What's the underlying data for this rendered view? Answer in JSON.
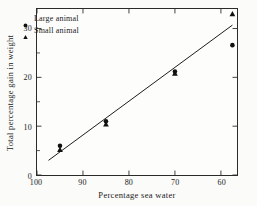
{
  "chart_data": {
    "type": "scatter",
    "title": "",
    "xlabel": "Percentage sea water",
    "ylabel": "Total percentage gain in weight",
    "xlim": [
      100,
      56.5
    ],
    "ylim": [
      0,
      34
    ],
    "x_axis_reversed": true,
    "grid": false,
    "xticks": [
      100,
      90,
      80,
      70,
      60
    ],
    "xtick_labels": [
      "100",
      "90",
      "80",
      "70",
      "60"
    ],
    "yticks": [
      0,
      10,
      20,
      30
    ],
    "ytick_labels": [
      "0",
      "10",
      "20",
      "30"
    ],
    "y_minor_ticks": [
      5,
      15,
      25
    ],
    "legend_position": "upper left",
    "series": [
      {
        "name": "Large animal",
        "marker": "circle",
        "color": "#111111",
        "points": [
          {
            "x": 95.0,
            "y": 6.0
          },
          {
            "x": 85.0,
            "y": 11.0
          },
          {
            "x": 70.0,
            "y": 21.2
          },
          {
            "x": 57.5,
            "y": 26.6
          }
        ]
      },
      {
        "name": "Small animal",
        "marker": "triangle",
        "color": "#111111",
        "points": [
          {
            "x": 95.0,
            "y": 5.2
          },
          {
            "x": 85.0,
            "y": 10.4
          },
          {
            "x": 70.0,
            "y": 20.8
          },
          {
            "x": 57.5,
            "y": 33.0
          }
        ]
      }
    ],
    "fit_line": {
      "name": "fitted regression line",
      "x_start": 97.5,
      "y_start": 3.0,
      "x_end": 57.5,
      "y_end": 30.7
    }
  },
  "legend": {
    "entries": [
      {
        "label": "Large animal",
        "marker": "circle"
      },
      {
        "label": "Small animal",
        "marker": "triangle"
      }
    ]
  }
}
